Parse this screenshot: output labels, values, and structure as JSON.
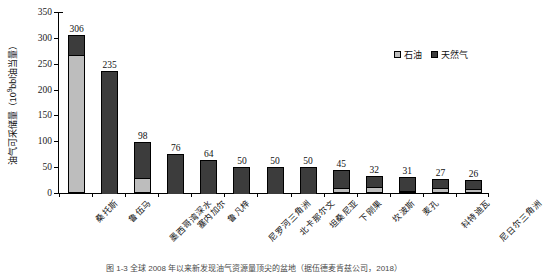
{
  "chart_data": {
    "type": "bar",
    "title": "",
    "xlabel": "",
    "ylabel": "油气可采储量（10⁹bbl油当量）",
    "ylabel_prefix": "油气可采储量（10",
    "ylabel_exponent": "9",
    "ylabel_suffix": "bbl油当量）",
    "ylim": [
      0,
      350
    ],
    "yticks": [
      0,
      50,
      100,
      150,
      200,
      250,
      300,
      350
    ],
    "ytick_labels": [
      "0",
      "50",
      "100",
      "150",
      "200",
      "250",
      "300",
      "350"
    ],
    "grid": false,
    "stacked": true,
    "legend_position": "top-right",
    "categories": [
      "桑托斯",
      "鲁伍马",
      "墨西哥湾深水",
      "塞内加尔",
      "鲁凡梓",
      "尼罗河三角洲",
      "北卡那尔文",
      "坦桑尼亚",
      "下刚果",
      "坎波斯",
      "麦孔",
      "科特迪瓦",
      "尼日尔三角洲"
    ],
    "totals": [
      306,
      235,
      98,
      76,
      64,
      50,
      50,
      50,
      45,
      32,
      31,
      27,
      26
    ],
    "series": [
      {
        "name": "石油",
        "color": "#bdbdbd",
        "values": [
          268,
          0,
          30,
          0,
          0,
          0,
          0,
          0,
          12,
          14,
          6,
          11,
          10
        ]
      },
      {
        "name": "天然气",
        "color": "#3c3c3c",
        "values": [
          38,
          235,
          68,
          76,
          64,
          50,
          50,
          50,
          33,
          18,
          25,
          16,
          16
        ]
      }
    ],
    "data_labels": [
      "306",
      "235",
      "98",
      "76",
      "64",
      "50",
      "50",
      "50",
      "45",
      "32",
      "31",
      "27",
      "26"
    ]
  },
  "legend": {
    "items": [
      {
        "label": "石油",
        "color": "#bdbdbd"
      },
      {
        "label": "天然气",
        "color": "#3c3c3c"
      }
    ]
  },
  "caption": {
    "text": "图 1-3  全球 2008 年以来新发现油气资源量顶尖的盆地（据伍德麦肯兹公司，2018）"
  },
  "colors": {
    "oil": "#bdbdbd",
    "gas": "#3c3c3c",
    "axis": "#000000",
    "background": "#ffffff"
  }
}
